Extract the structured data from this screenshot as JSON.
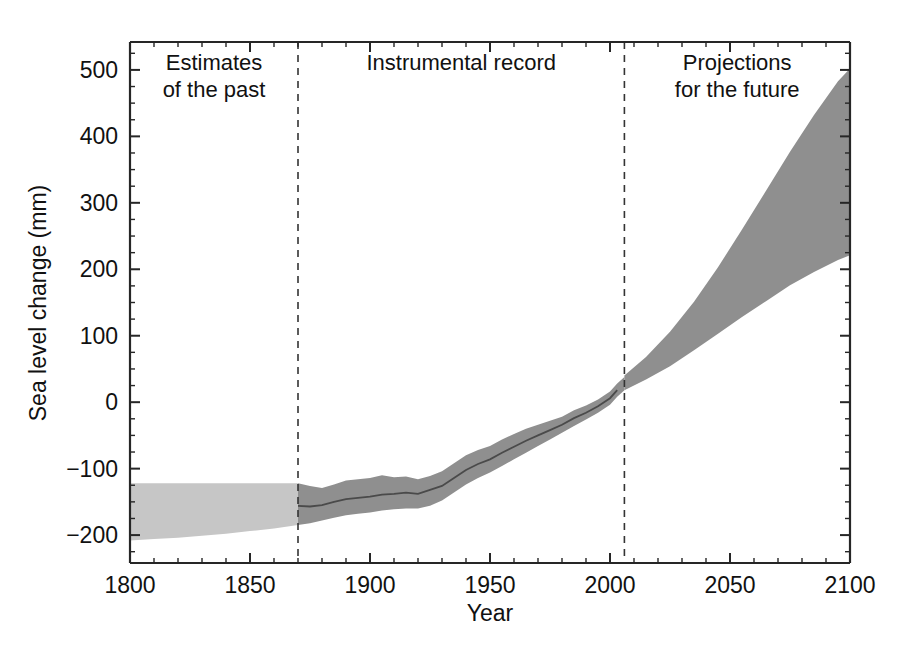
{
  "chart_data": {
    "type": "area",
    "title": "",
    "subtitle": "",
    "xlabel": "Year",
    "ylabel": "Sea level change (mm)",
    "xlim": [
      1800,
      2100
    ],
    "ylim": [
      -242,
      542
    ],
    "x_ticks_major": [
      1800,
      1850,
      1900,
      1950,
      2000,
      2050,
      2100
    ],
    "x_tick_labels": [
      "1800",
      "1850",
      "1900",
      "1950",
      "2000",
      "2050",
      "2100"
    ],
    "x_tick_minor_step": 10,
    "y_ticks_major": [
      -200,
      -100,
      0,
      100,
      200,
      300,
      400,
      500
    ],
    "y_tick_labels": [
      "-200",
      "-100",
      "0",
      "100",
      "200",
      "300",
      "400",
      "500"
    ],
    "y_tick_minor_step": 25,
    "grid": false,
    "legend_position": "none",
    "panel_dividers": [
      1870,
      2006
    ],
    "annotations": [
      {
        "name": "estimates-of-the-past",
        "line1": "Estimates",
        "line2": "of the past",
        "x": 1835,
        "y": 500
      },
      {
        "name": "instrumental-record",
        "line1": "Instrumental record",
        "line2": "",
        "x": 1938,
        "y": 500
      },
      {
        "name": "projections-for-the-future",
        "line1": "Projections",
        "line2": "for the future",
        "x": 2053,
        "y": 500
      }
    ],
    "series": [
      {
        "name": "Estimates of the past (uncertainty band)",
        "type": "band",
        "color": "#c6c6c6",
        "x": [
          1800,
          1810,
          1820,
          1830,
          1840,
          1850,
          1860,
          1870
        ],
        "upper": [
          -122,
          -122,
          -122,
          -122,
          -122,
          -122,
          -122,
          -122
        ],
        "lower": [
          -208,
          -206,
          -204,
          -201,
          -198,
          -194,
          -190,
          -185
        ]
      },
      {
        "name": "Instrumental record (uncertainty band)",
        "type": "band",
        "color": "#8f8f8f",
        "x": [
          1870,
          1875,
          1880,
          1885,
          1890,
          1895,
          1900,
          1905,
          1910,
          1915,
          1920,
          1925,
          1930,
          1935,
          1940,
          1945,
          1950,
          1955,
          1960,
          1965,
          1970,
          1975,
          1980,
          1985,
          1990,
          1995,
          2000,
          2003,
          2006
        ],
        "upper": [
          -122,
          -126,
          -129,
          -124,
          -118,
          -116,
          -114,
          -110,
          -113,
          -112,
          -116,
          -111,
          -104,
          -92,
          -80,
          -72,
          -66,
          -56,
          -48,
          -40,
          -34,
          -28,
          -22,
          -12,
          -5,
          4,
          16,
          28,
          38
        ],
        "lower": [
          -185,
          -182,
          -178,
          -174,
          -170,
          -168,
          -166,
          -163,
          -161,
          -160,
          -160,
          -156,
          -148,
          -136,
          -124,
          -114,
          -106,
          -96,
          -86,
          -76,
          -66,
          -56,
          -46,
          -36,
          -26,
          -16,
          -4,
          8,
          18
        ]
      },
      {
        "name": "Instrumental record (central estimate)",
        "type": "line",
        "color": "#4a4a4a",
        "x": [
          1870,
          1875,
          1880,
          1885,
          1890,
          1895,
          1900,
          1905,
          1910,
          1915,
          1920,
          1925,
          1930,
          1935,
          1940,
          1945,
          1950,
          1955,
          1960,
          1965,
          1970,
          1975,
          1980,
          1985,
          1990,
          1995,
          2000,
          2003
        ],
        "y": [
          -156,
          -157,
          -155,
          -150,
          -146,
          -144,
          -142,
          -139,
          -138,
          -136,
          -138,
          -132,
          -126,
          -114,
          -102,
          -93,
          -86,
          -76,
          -67,
          -58,
          -50,
          -42,
          -34,
          -24,
          -16,
          -6,
          6,
          18
        ]
      },
      {
        "name": "Projections for the future (envelope)",
        "type": "band",
        "color": "#8f8f8f",
        "x": [
          2006,
          2015,
          2025,
          2035,
          2045,
          2055,
          2065,
          2075,
          2085,
          2095,
          2100
        ],
        "upper": [
          40,
          68,
          106,
          151,
          203,
          260,
          318,
          377,
          432,
          483,
          502
        ],
        "lower": [
          18,
          34,
          54,
          78,
          103,
          128,
          152,
          176,
          196,
          214,
          221
        ]
      }
    ]
  },
  "axes": {
    "y_axis_title": "Sea level change (mm)",
    "x_axis_title": "Year"
  },
  "colors": {
    "light_band": "#c6c6c6",
    "dark_band": "#8f8f8f",
    "center_line": "#4a4a4a",
    "axis": "#262626",
    "divider": "#333333",
    "background": "#ffffff"
  }
}
